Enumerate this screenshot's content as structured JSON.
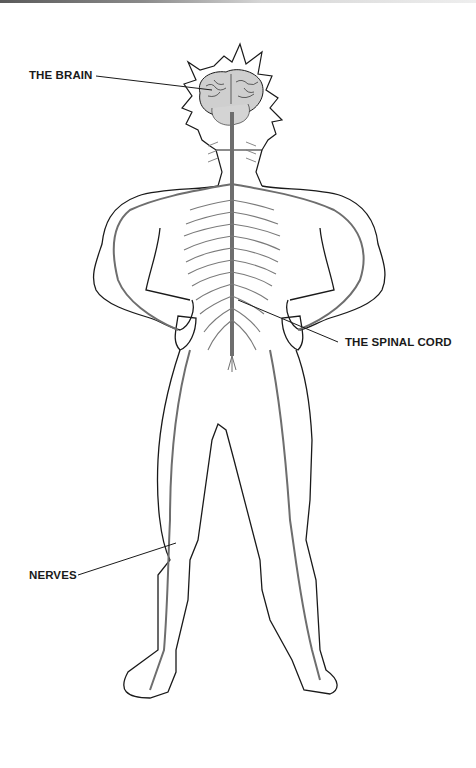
{
  "diagram": {
    "labels": {
      "brain": "THE BRAIN",
      "spinal_cord": "THE SPINAL CORD",
      "nerves": "NERVES"
    },
    "colors": {
      "outline": "#1a1a1a",
      "nerve": "#6e6e6e",
      "brain_fill": "#cfcfcf",
      "background": "#ffffff"
    }
  }
}
